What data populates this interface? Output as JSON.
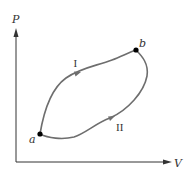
{
  "diagram": {
    "type": "PV diagram",
    "axes": {
      "y_label": "P",
      "x_label": "V"
    },
    "points": [
      {
        "id": "a",
        "label": "a"
      },
      {
        "id": "b",
        "label": "b"
      }
    ],
    "paths": [
      {
        "id": "I",
        "label": "I",
        "from": "a",
        "to": "b",
        "position": "upper"
      },
      {
        "id": "II",
        "label": "II",
        "from": "a",
        "to": "b",
        "position": "lower"
      }
    ],
    "colors": {
      "axis": "#333333",
      "curve": "#6e6e6e",
      "point": "#000000",
      "text": "#333333"
    }
  }
}
